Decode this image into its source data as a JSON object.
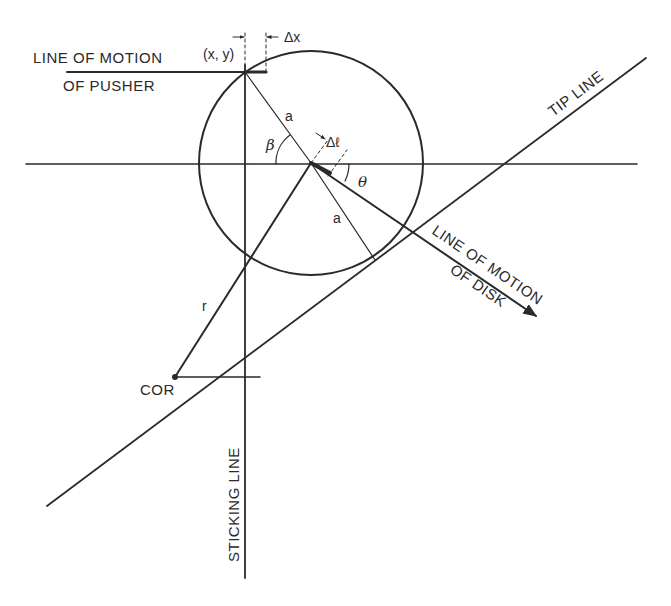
{
  "diagram": {
    "title": "",
    "labels": {
      "pusher_line_1": "LINE OF MOTION",
      "pusher_line_2": "OF PUSHER",
      "contact_point": "(x, y)",
      "delta_x": "Δx",
      "radius_upper": "a",
      "radius_lower": "a",
      "beta": "β",
      "delta_l": "Δℓ",
      "theta": "θ",
      "tip_line": "TIP LINE",
      "disk_line_1": "LINE OF MOTION",
      "disk_line_2": "OF DISK",
      "r": "r",
      "cor": "COR",
      "sticking_line": "STICKING LINE"
    },
    "elements": [
      {
        "name": "disk",
        "type": "circle",
        "center": [
          311,
          163
        ],
        "radius": 112
      },
      {
        "name": "horizontal-axis",
        "type": "line"
      },
      {
        "name": "sticking-line",
        "type": "line",
        "orientation": "vertical"
      },
      {
        "name": "tip-line",
        "type": "line"
      },
      {
        "name": "pusher-motion-line",
        "type": "line"
      },
      {
        "name": "disk-motion-line",
        "type": "arrow"
      },
      {
        "name": "center-of-rotation",
        "type": "point"
      }
    ],
    "colors": {
      "ink": "#2a2a2a",
      "background": "#ffffff"
    }
  }
}
